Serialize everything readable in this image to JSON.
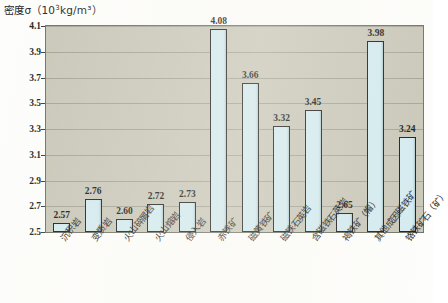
{
  "chart_data": {
    "type": "bar",
    "title_prefix": "密度σ（10",
    "title_exponent": "3",
    "title_suffix": "kg/m³）",
    "xlabel": "",
    "ylabel": "密度σ（10³kg/m³）",
    "ylim": [
      2.5,
      4.1
    ],
    "ytick_step": 0.2,
    "grid": true,
    "legend": "none",
    "ytick_labels": [
      "4.1",
      "3.9",
      "3.7",
      "3.5",
      "3.3",
      "3.1",
      "2.9",
      "2.7",
      "2.5"
    ],
    "categories": [
      "沉积岩",
      "变质岩",
      "火山碎屑岩",
      "火山熔岩",
      "侵入岩",
      "赤铁矿",
      "磁黄铁矿",
      "磁铁石英岩",
      "含磁铁石英岩",
      "褐铁矿（帽）",
      "其他成因磁铁矿",
      "铬铁矿石（矿）"
    ],
    "values": [
      2.57,
      2.76,
      2.6,
      2.72,
      2.73,
      4.08,
      3.66,
      3.32,
      3.45,
      2.65,
      3.98,
      3.24
    ],
    "value_labels": [
      "2.57",
      "2.76",
      "2.60",
      "2.72",
      "2.73",
      "4.08",
      "3.66",
      "3.32",
      "3.45",
      "2.65",
      "3.98",
      "3.24"
    ],
    "colors": {
      "bar_fill": "#d3ebf0",
      "bar_border": "#1b1b1b",
      "plot_background": "#c8c7b8",
      "gridline": "#9d9c8e",
      "page_background": "#fdfdfb",
      "text": "#1d1d1d"
    }
  }
}
